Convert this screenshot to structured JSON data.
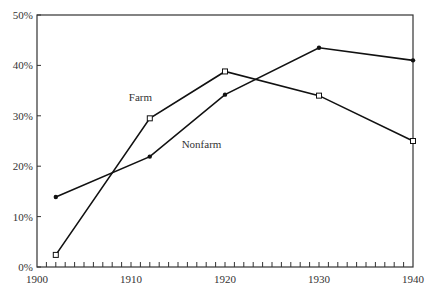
{
  "chart_data": {
    "type": "line",
    "title": "",
    "xlabel": "",
    "ylabel": "",
    "xlim": [
      1900,
      1940
    ],
    "ylim": [
      0,
      50
    ],
    "x_ticks": [
      1900,
      1910,
      1920,
      1930,
      1940
    ],
    "x_tick_labels": [
      "1900",
      "1910",
      "1920",
      "1930",
      "1940"
    ],
    "x_minor_ticks": "yearly",
    "y_ticks": [
      0,
      10,
      20,
      30,
      40,
      50
    ],
    "y_tick_labels": [
      "0%",
      "10%",
      "20%",
      "30%",
      "40%",
      "50%"
    ],
    "grid": false,
    "legend": "inline labels",
    "series": [
      {
        "name": "Farm",
        "marker": "open-square",
        "x": [
          1902,
          1912,
          1920,
          1930,
          1940
        ],
        "values": [
          2.4,
          29.5,
          38.8,
          34.0,
          25.0
        ],
        "label_pos": {
          "x": 1911,
          "y": 33
        }
      },
      {
        "name": "Nonfarm",
        "marker": "filled-circle",
        "x": [
          1902,
          1912,
          1920,
          1930,
          1940
        ],
        "values": [
          13.9,
          21.9,
          34.2,
          43.5,
          41.0
        ],
        "label_pos": {
          "x": 1917.5,
          "y": 23.6
        }
      }
    ]
  }
}
